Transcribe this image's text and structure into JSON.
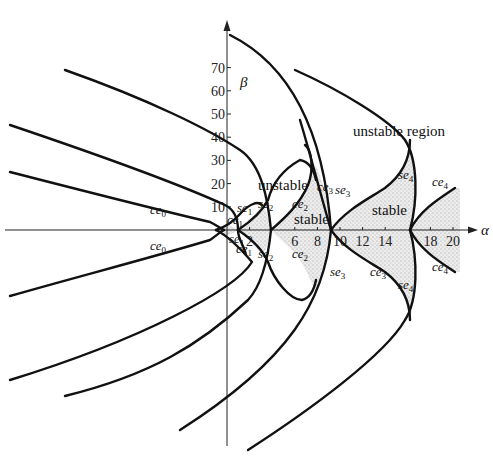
{
  "figure": {
    "x_axis": {
      "symbol": "α",
      "ticks": [
        "2",
        "6",
        "8",
        "10",
        "12",
        "14",
        "18",
        "20"
      ]
    },
    "y_axis": {
      "symbol": "β",
      "ticks": [
        "10",
        "20",
        "30",
        "40",
        "50",
        "60",
        "70"
      ]
    },
    "regions": {
      "unstable_region": "unstable region",
      "unstable": "unstable",
      "stable_1": "stable",
      "stable_2": "stable"
    },
    "curve_labels": {
      "ce0_upper": {
        "base": "ce",
        "sub": "0"
      },
      "ce0_lower": {
        "base": "ce",
        "sub": "0"
      },
      "ce1_upper": {
        "base": "ce",
        "sub": "1"
      },
      "ce1_lower": {
        "base": "ce",
        "sub": "1"
      },
      "se1_upper": {
        "base": "se",
        "sub": "1"
      },
      "se1_lower": {
        "base": "se",
        "sub": "1"
      },
      "se2_upper": {
        "base": "se",
        "sub": "2"
      },
      "se2_lower": {
        "base": "se",
        "sub": "2"
      },
      "ce2_upper": {
        "base": "ce",
        "sub": "2"
      },
      "ce2_lower": {
        "base": "ce",
        "sub": "2"
      },
      "ce3_upper": {
        "base": "ce",
        "sub": "3"
      },
      "ce3_lower": {
        "base": "ce",
        "sub": "3"
      },
      "se3_upper": {
        "base": "se",
        "sub": "3"
      },
      "se3_lower": {
        "base": "se",
        "sub": "3"
      },
      "se4_upper": {
        "base": "se",
        "sub": "4"
      },
      "se4_lower": {
        "base": "se",
        "sub": "4"
      },
      "ce4_upper": {
        "base": "ce",
        "sub": "4"
      },
      "ce4_lower": {
        "base": "ce",
        "sub": "4"
      }
    },
    "colors": {
      "ink": "#111111",
      "stable_fill": "#e2e2e2",
      "background": "#ffffff"
    }
  }
}
